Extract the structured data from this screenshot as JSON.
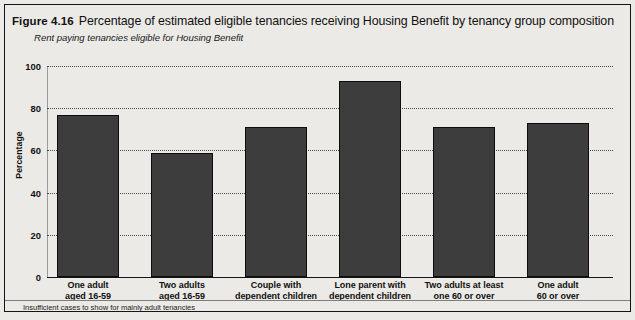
{
  "figure": {
    "label": "Figure 4.16",
    "title": "Percentage of estimated eligible tenancies receiving Housing Benefit by tenancy group composition",
    "subtitle": "Rent paying tenancies eligible for Housing Benefit",
    "footnote": "Insufficient cases to show for mainly adult tenancies"
  },
  "colors": {
    "bar_fill": "#3d3d3d",
    "bar_stroke": "#0d0d0d",
    "panel_background": "#eceae6",
    "frame": "#151515",
    "gridline": "#4a4a4a",
    "text": "#111111"
  },
  "chart_data": {
    "type": "bar",
    "title": "Percentage of estimated eligible tenancies receiving Housing Benefit by tenancy group composition",
    "subtitle": "Rent paying tenancies eligible for Housing Benefit",
    "xlabel": "",
    "ylabel": "Percentage",
    "ylim": [
      0,
      100
    ],
    "yticks": [
      0,
      20,
      40,
      60,
      80,
      100
    ],
    "ytick_labels": [
      "0",
      "20",
      "40",
      "60",
      "80",
      "100"
    ],
    "grid": true,
    "legend": false,
    "categories": [
      "One adult aged 16-59",
      "Two adults aged 16-59",
      "Couple with dependent children",
      "Lone parent with dependent children",
      "Two adults at least one 60 or over",
      "One adult 60 or over"
    ],
    "category_lines": [
      [
        "One adult",
        "aged 16-59"
      ],
      [
        "Two adults",
        "aged 16-59"
      ],
      [
        "Couple with",
        "dependent children"
      ],
      [
        "Lone parent with",
        "dependent children"
      ],
      [
        "Two adults at least",
        "one 60 or over"
      ],
      [
        "One adult",
        "60 or over"
      ]
    ],
    "values": [
      77,
      59,
      71,
      93,
      71,
      73
    ],
    "annotations": [
      "Insufficient cases to show for mainly adult tenancies"
    ]
  }
}
